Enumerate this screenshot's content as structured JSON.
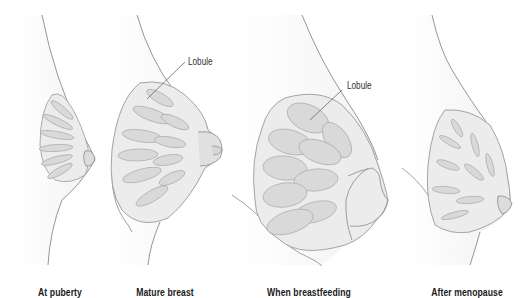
{
  "diagram": {
    "stages": [
      {
        "caption": "At puberty"
      },
      {
        "caption": "Mature breast",
        "callout": "Lobule"
      },
      {
        "caption": "When breastfeeding",
        "callout": "Lobule"
      },
      {
        "caption": "After menopause"
      }
    ],
    "colors": {
      "outline": "#8a8a8a",
      "tissue_fill": "#ececec",
      "lobule_fill": "#d9d9d9",
      "skin_shade": "#f4f4f4",
      "text": "#1a1a1a"
    }
  }
}
